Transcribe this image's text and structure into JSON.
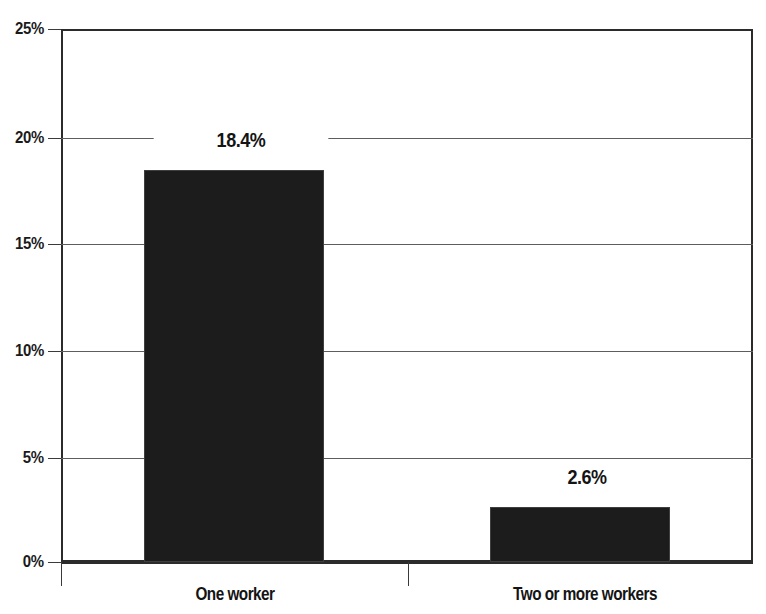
{
  "chart_data": {
    "type": "bar",
    "title": "",
    "subtitle": "",
    "xlabel": "",
    "ylabel": "",
    "categories": [
      "One worker",
      "Two or more workers"
    ],
    "values": [
      18.4,
      2.6
    ],
    "data_labels": [
      "18.4%",
      "2.6%"
    ],
    "ylim": [
      0,
      25
    ],
    "ytick_values": [
      0,
      5,
      10,
      15,
      20,
      25
    ],
    "ytick_labels": [
      "0%",
      "5%",
      "10%",
      "15%",
      "20%",
      "25%"
    ],
    "grid": "horizontal",
    "legend": "none",
    "series": [
      {
        "name": "",
        "color": "#1c1c1c",
        "values": [
          18.4,
          2.6
        ]
      }
    ],
    "annotations": []
  },
  "axes": {
    "y": {
      "ticks": [
        {
          "label": "25%",
          "value": 25
        },
        {
          "label": "20%",
          "value": 20
        },
        {
          "label": "15%",
          "value": 15
        },
        {
          "label": "10%",
          "value": 10
        },
        {
          "label": "5%",
          "value": 5
        },
        {
          "label": "0%",
          "value": 0
        }
      ]
    },
    "x": {
      "ticks": [
        {
          "label": "One worker"
        },
        {
          "label": "Two or more workers"
        }
      ]
    }
  },
  "colors": {
    "bar_fill": "#1c1c1c",
    "frame": "#2b2b2b",
    "gridline": "#5d5d5d",
    "text": "#141414",
    "background": "#ffffff"
  }
}
